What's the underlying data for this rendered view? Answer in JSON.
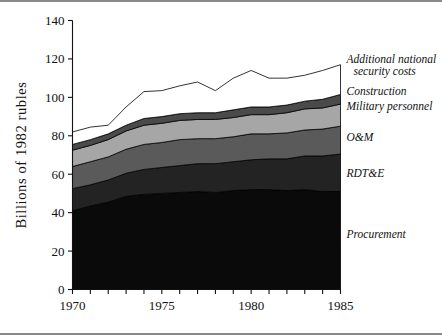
{
  "figure": {
    "background": "#ffffff",
    "rule_color": "#8a8a8a"
  },
  "chart_data": {
    "type": "area",
    "title": "",
    "subtitle": "",
    "xlabel": "",
    "ylabel": "Billions of 1982 rubles",
    "xlim": [
      1970,
      1985
    ],
    "ylim": [
      0,
      140
    ],
    "ytick_values": [
      0,
      20,
      40,
      60,
      80,
      100,
      120,
      140
    ],
    "ytick_labels": [
      "0",
      "20",
      "40",
      "60",
      "80",
      "100",
      "120",
      "140"
    ],
    "xtick_values": [
      1970,
      1971,
      1972,
      1973,
      1974,
      1975,
      1976,
      1977,
      1978,
      1979,
      1980,
      1981,
      1982,
      1983,
      1984,
      1985
    ],
    "xtick_labels_shown": [
      "1970",
      "1975",
      "1980",
      "1985"
    ],
    "xtick_labeled_values": [
      1970,
      1975,
      1980,
      1985
    ],
    "grid": false,
    "legend_position": "right-inline",
    "stacked": true,
    "x": [
      1970,
      1971,
      1972,
      1973,
      1974,
      1975,
      1976,
      1977,
      1978,
      1979,
      1980,
      1981,
      1982,
      1983,
      1984,
      1985
    ],
    "series": [
      {
        "name": "Procurement",
        "color": "#0a0a0a",
        "label": "Procurement",
        "values": [
          41.0,
          43.5,
          45.5,
          48.5,
          49.5,
          50.0,
          50.5,
          51.0,
          50.5,
          51.5,
          52.0,
          52.0,
          51.5,
          52.0,
          51.0,
          51.0
        ]
      },
      {
        "name": "RDT&E",
        "color": "#232323",
        "label": "RDT&E",
        "values": [
          11.5,
          11.0,
          11.5,
          12.0,
          13.0,
          13.5,
          14.0,
          14.5,
          15.0,
          15.0,
          15.5,
          16.0,
          16.5,
          17.5,
          18.5,
          19.5
        ]
      },
      {
        "name": "O&M",
        "color": "#5a5a5a",
        "label": "O&M",
        "values": [
          11.5,
          12.0,
          12.0,
          12.5,
          13.0,
          13.0,
          13.5,
          13.0,
          13.0,
          13.0,
          13.5,
          13.0,
          13.5,
          13.5,
          14.0,
          14.5
        ]
      },
      {
        "name": "Military personnel",
        "color": "#a6a6a6",
        "label": "Military personnel",
        "values": [
          8.5,
          8.5,
          9.0,
          9.5,
          10.0,
          10.0,
          10.0,
          10.0,
          10.0,
          10.0,
          10.0,
          10.0,
          10.5,
          11.0,
          11.0,
          11.5
        ]
      },
      {
        "name": "Construction",
        "color": "#4a4a4a",
        "label": "Construction",
        "values": [
          3.0,
          3.0,
          3.0,
          3.0,
          3.5,
          3.5,
          3.5,
          3.5,
          3.5,
          4.0,
          4.0,
          4.0,
          4.0,
          4.0,
          4.5,
          5.0
        ]
      },
      {
        "name": "Additional national security costs",
        "color": "#ffffff",
        "label": "Additional national\n  security costs",
        "values": [
          6.5,
          6.5,
          4.5,
          9.5,
          14.0,
          13.5,
          14.5,
          16.0,
          11.5,
          16.5,
          19.0,
          15.0,
          14.0,
          13.5,
          15.0,
          15.5
        ]
      }
    ],
    "series_labels": [
      "Additional national",
      "security costs",
      "Construction",
      "Military personnel",
      "O&M",
      "RDT&E",
      "Procurement"
    ]
  }
}
